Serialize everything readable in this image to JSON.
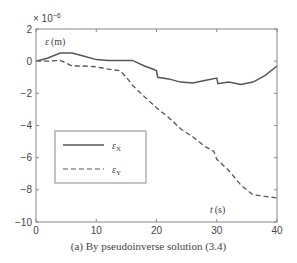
{
  "chart_data": {
    "type": "line",
    "title": "",
    "caption": "(a) By pseudoinverse solution (3.4)",
    "xlabel": "t (s)",
    "ylabel": "ε (m)",
    "y_multiplier": "× 10^-6",
    "xlim": [
      0,
      40
    ],
    "ylim": [
      -10,
      2
    ],
    "xticks": [
      0,
      10,
      20,
      30,
      40
    ],
    "yticks": [
      2,
      0,
      -2,
      -4,
      -6,
      -8,
      -10
    ],
    "grid": false,
    "legend_position": "lower-left inside",
    "series": [
      {
        "name": "εX",
        "style": "solid",
        "x": [
          0,
          2,
          4,
          6,
          8,
          10,
          12,
          14,
          16,
          18,
          19.5,
          20,
          20.2,
          22,
          24,
          26,
          28,
          30,
          30.2,
          32,
          34,
          36,
          38,
          40
        ],
        "y": [
          0,
          0.2,
          0.5,
          0.5,
          0.3,
          0.1,
          0.05,
          0.05,
          0.05,
          -0.3,
          -0.5,
          -0.6,
          -1.0,
          -1.1,
          -1.3,
          -1.35,
          -1.2,
          -1.05,
          -1.4,
          -1.3,
          -1.45,
          -1.3,
          -0.9,
          -0.3
        ]
      },
      {
        "name": "εY",
        "style": "dashed",
        "x": [
          0,
          2,
          4,
          6,
          8,
          10,
          12,
          14,
          15,
          16,
          18,
          20,
          22,
          24,
          26,
          28,
          29.5,
          30,
          30.3,
          32,
          34,
          36,
          38,
          40
        ],
        "y": [
          0,
          0,
          0.05,
          -0.3,
          -0.3,
          -0.35,
          -0.5,
          -0.6,
          -1.0,
          -1.5,
          -2.2,
          -2.9,
          -3.5,
          -4.2,
          -4.7,
          -5.3,
          -5.6,
          -6.1,
          -6.2,
          -6.8,
          -7.7,
          -8.3,
          -8.4,
          -8.5
        ]
      }
    ]
  },
  "legend": {
    "items": [
      {
        "label": "εX",
        "sym": "ε",
        "sub": "X"
      },
      {
        "label": "εY",
        "sym": "ε",
        "sub": "Y"
      }
    ]
  },
  "axis": {
    "y_exponent_base": "× 10",
    "y_exponent_power": "−6",
    "ylabel_sym": "ε",
    "ylabel_unit": "(m)",
    "xlabel_sym": "t",
    "xlabel_unit": "(s)"
  },
  "colors": {
    "line": "#555555",
    "axis": "#777777"
  }
}
